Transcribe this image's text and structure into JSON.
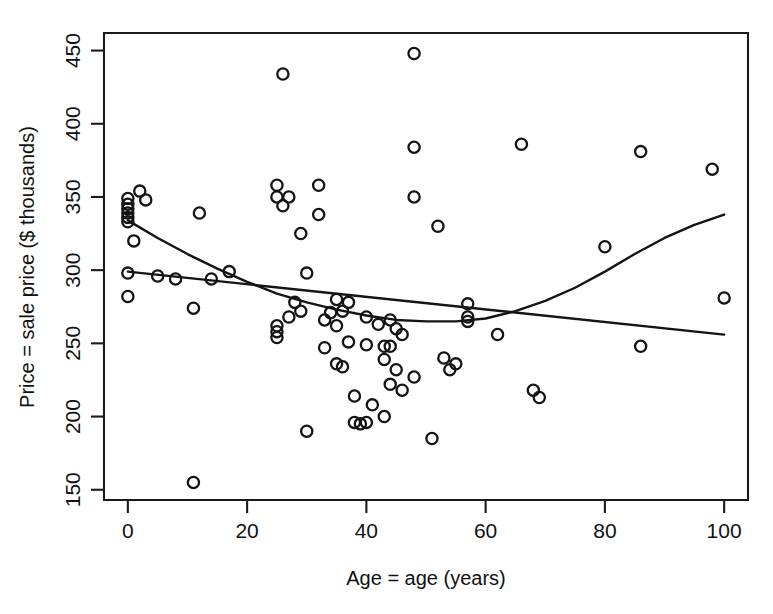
{
  "chart_data": {
    "type": "scatter",
    "title": "",
    "xlabel": "Age = age (years)",
    "ylabel": "Price = sale price ($ thousands)",
    "xlim": [
      -4,
      104
    ],
    "ylim": [
      143,
      462
    ],
    "xticks": [
      0,
      20,
      40,
      60,
      80,
      100
    ],
    "yticks": [
      150,
      200,
      250,
      300,
      350,
      400,
      450
    ],
    "xticklabels": [
      "0",
      "20",
      "40",
      "60",
      "80",
      "100"
    ],
    "yticklabels": [
      "150",
      "200",
      "250",
      "300",
      "350",
      "400",
      "450"
    ],
    "grid": false,
    "legend": false,
    "marker": "open-circle",
    "points": [
      [
        0,
        349
      ],
      [
        0,
        345
      ],
      [
        0,
        342
      ],
      [
        0,
        339
      ],
      [
        0,
        336
      ],
      [
        0,
        333
      ],
      [
        0,
        298
      ],
      [
        0,
        282
      ],
      [
        1,
        320
      ],
      [
        2,
        354
      ],
      [
        3,
        348
      ],
      [
        5,
        296
      ],
      [
        8,
        294
      ],
      [
        11,
        274
      ],
      [
        11,
        155
      ],
      [
        12,
        339
      ],
      [
        14,
        294
      ],
      [
        17,
        299
      ],
      [
        25,
        358
      ],
      [
        25,
        350
      ],
      [
        25,
        262
      ],
      [
        25,
        258
      ],
      [
        25,
        254
      ],
      [
        26,
        434
      ],
      [
        26,
        344
      ],
      [
        27,
        350
      ],
      [
        27,
        268
      ],
      [
        28,
        278
      ],
      [
        29,
        325
      ],
      [
        29,
        272
      ],
      [
        30,
        298
      ],
      [
        30,
        190
      ],
      [
        32,
        358
      ],
      [
        32,
        338
      ],
      [
        33,
        266
      ],
      [
        33,
        247
      ],
      [
        34,
        271
      ],
      [
        35,
        280
      ],
      [
        35,
        262
      ],
      [
        35,
        236
      ],
      [
        36,
        272
      ],
      [
        36,
        234
      ],
      [
        37,
        278
      ],
      [
        37,
        251
      ],
      [
        38,
        214
      ],
      [
        38,
        196
      ],
      [
        39,
        195
      ],
      [
        40,
        268
      ],
      [
        40,
        249
      ],
      [
        40,
        196
      ],
      [
        41,
        208
      ],
      [
        42,
        263
      ],
      [
        43,
        248
      ],
      [
        43,
        239
      ],
      [
        43,
        200
      ],
      [
        44,
        266
      ],
      [
        44,
        248
      ],
      [
        44,
        222
      ],
      [
        45,
        260
      ],
      [
        45,
        232
      ],
      [
        46,
        256
      ],
      [
        46,
        218
      ],
      [
        48,
        448
      ],
      [
        48,
        384
      ],
      [
        48,
        350
      ],
      [
        48,
        227
      ],
      [
        51,
        185
      ],
      [
        52,
        330
      ],
      [
        53,
        240
      ],
      [
        54,
        232
      ],
      [
        55,
        236
      ],
      [
        57,
        277
      ],
      [
        57,
        268
      ],
      [
        57,
        265
      ],
      [
        62,
        256
      ],
      [
        66,
        386
      ],
      [
        68,
        218
      ],
      [
        69,
        213
      ],
      [
        80,
        316
      ],
      [
        86,
        381
      ],
      [
        86,
        248
      ],
      [
        98,
        369
      ],
      [
        100,
        281
      ]
    ],
    "curves": [
      {
        "name": "quadratic-fit",
        "comment": "U-shaped curve, steep decline then rise",
        "points": [
          [
            0,
            334
          ],
          [
            5,
            322
          ],
          [
            10,
            311
          ],
          [
            15,
            301
          ],
          [
            20,
            292
          ],
          [
            25,
            284
          ],
          [
            30,
            278
          ],
          [
            35,
            273
          ],
          [
            40,
            269
          ],
          [
            45,
            266
          ],
          [
            50,
            265
          ],
          [
            55,
            265
          ],
          [
            60,
            267
          ],
          [
            65,
            272
          ],
          [
            70,
            279
          ],
          [
            75,
            288
          ],
          [
            80,
            299
          ],
          [
            85,
            311
          ],
          [
            90,
            322
          ],
          [
            95,
            331
          ],
          [
            100,
            338
          ]
        ]
      },
      {
        "name": "linear-fit",
        "comment": "nearly flat, gently declining straight line",
        "points": [
          [
            0,
            299
          ],
          [
            100,
            256
          ]
        ]
      }
    ]
  }
}
